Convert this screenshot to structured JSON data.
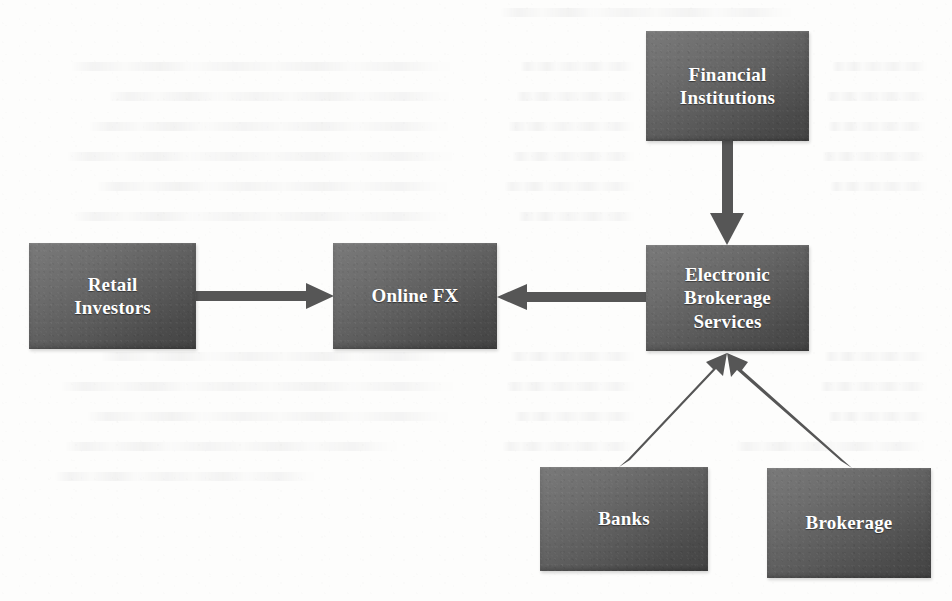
{
  "diagram": {
    "type": "flow-diagram",
    "background_color": "#fdfdfc",
    "node_fill_color": "#5b5b5b",
    "node_text_color": "#ffffff",
    "connector_color": "#565656",
    "nodes": [
      {
        "id": "retail",
        "label": "Retail\nInvestors",
        "line1": "Retail",
        "line2": "Investors",
        "line3": ""
      },
      {
        "id": "onlinefx",
        "label": "Online FX",
        "line1": "Online FX",
        "line2": "",
        "line3": ""
      },
      {
        "id": "fininst",
        "label": "Financial\nInstitutions",
        "line1": "Financial",
        "line2": "Institutions",
        "line3": ""
      },
      {
        "id": "ebs",
        "label": "Electronic\nBrokerage\nServices",
        "line1": "Electronic",
        "line2": "Brokerage",
        "line3": "Services"
      },
      {
        "id": "banks",
        "label": "Banks",
        "line1": "Banks",
        "line2": "",
        "line3": ""
      },
      {
        "id": "brokerage",
        "label": "Brokerage",
        "line1": "Brokerage",
        "line2": "",
        "line3": ""
      }
    ],
    "edges": [
      {
        "id": "retail-to-onlinefx",
        "from": "retail",
        "to": "onlinefx",
        "direction": "right",
        "style": "solid-arrow"
      },
      {
        "id": "ebs-to-onlinefx",
        "from": "ebs",
        "to": "onlinefx",
        "direction": "left",
        "style": "solid-arrow"
      },
      {
        "id": "fininst-to-ebs",
        "from": "fininst",
        "to": "ebs",
        "direction": "down",
        "style": "solid-arrow"
      },
      {
        "id": "banks-to-ebs",
        "from": "banks",
        "to": "ebs",
        "direction": "up-right",
        "style": "solid-arrow"
      },
      {
        "id": "brokerage-to-ebs",
        "from": "brokerage",
        "to": "ebs",
        "direction": "up-left",
        "style": "solid-arrow"
      }
    ]
  }
}
